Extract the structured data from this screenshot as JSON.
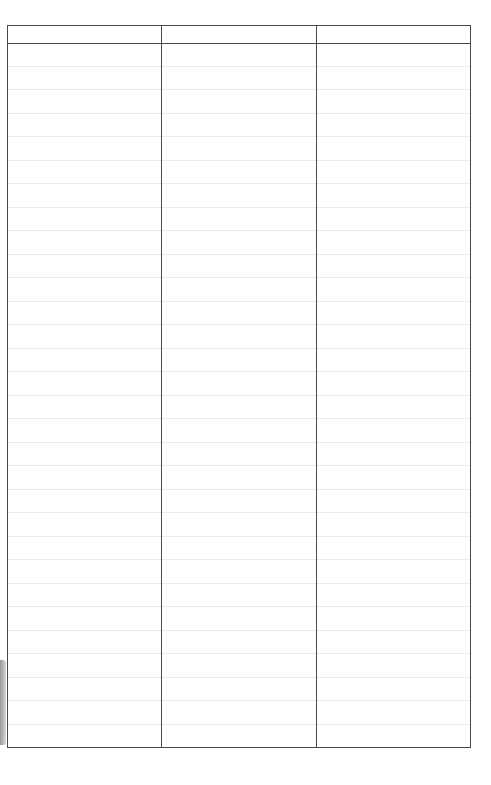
{
  "table": {
    "columns": [
      {
        "label": "",
        "width": 154
      },
      {
        "label": "",
        "width": 155
      },
      {
        "label": "",
        "width": 155
      }
    ],
    "row_count": 30,
    "rows": [],
    "colors": {
      "border": "#4a4a4a",
      "row_line": "#ececec",
      "background": "#ffffff"
    }
  }
}
